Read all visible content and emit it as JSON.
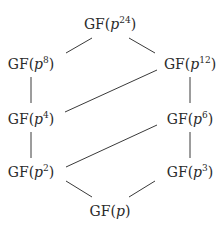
{
  "diagram": {
    "type": "subfield-lattice",
    "nodes": [
      {
        "id": "p24",
        "prefix": "GF(",
        "var": "p",
        "exp": "24",
        "suffix": ")",
        "x": 110,
        "y": 24
      },
      {
        "id": "p8",
        "prefix": "GF(",
        "var": "p",
        "exp": "8",
        "suffix": ")",
        "x": 31,
        "y": 64
      },
      {
        "id": "p12",
        "prefix": "GF(",
        "var": "p",
        "exp": "12",
        "suffix": ")",
        "x": 190,
        "y": 64
      },
      {
        "id": "p4",
        "prefix": "GF(",
        "var": "p",
        "exp": "4",
        "suffix": ")",
        "x": 31,
        "y": 119
      },
      {
        "id": "p6",
        "prefix": "GF(",
        "var": "p",
        "exp": "6",
        "suffix": ")",
        "x": 190,
        "y": 119
      },
      {
        "id": "p2",
        "prefix": "GF(",
        "var": "p",
        "exp": "2",
        "suffix": ")",
        "x": 31,
        "y": 172
      },
      {
        "id": "p3",
        "prefix": "GF(",
        "var": "p",
        "exp": "3",
        "suffix": ")",
        "x": 190,
        "y": 172
      },
      {
        "id": "p1",
        "prefix": "GF(",
        "var": "p",
        "exp": "",
        "suffix": ")",
        "x": 110,
        "y": 211
      }
    ],
    "edges": [
      {
        "from": "p24",
        "to": "p8",
        "x1": 66,
        "y1": 53,
        "x2": 92,
        "y2": 38
      },
      {
        "from": "p24",
        "to": "p12",
        "x1": 129,
        "y1": 38,
        "x2": 155,
        "y2": 53
      },
      {
        "from": "p8",
        "to": "p4",
        "x1": 31,
        "y1": 77,
        "x2": 31,
        "y2": 103
      },
      {
        "from": "p12",
        "to": "p4",
        "x1": 157,
        "y1": 70,
        "x2": 65,
        "y2": 112
      },
      {
        "from": "p12",
        "to": "p6",
        "x1": 190,
        "y1": 77,
        "x2": 190,
        "y2": 103
      },
      {
        "from": "p4",
        "to": "p2",
        "x1": 31,
        "y1": 132,
        "x2": 31,
        "y2": 158
      },
      {
        "from": "p6",
        "to": "p2",
        "x1": 157,
        "y1": 125,
        "x2": 66,
        "y2": 167
      },
      {
        "from": "p6",
        "to": "p3",
        "x1": 190,
        "y1": 132,
        "x2": 190,
        "y2": 158
      },
      {
        "from": "p2",
        "to": "p1",
        "x1": 66,
        "y1": 181,
        "x2": 92,
        "y2": 197
      },
      {
        "from": "p3",
        "to": "p1",
        "x1": 155,
        "y1": 181,
        "x2": 129,
        "y2": 197
      }
    ]
  }
}
